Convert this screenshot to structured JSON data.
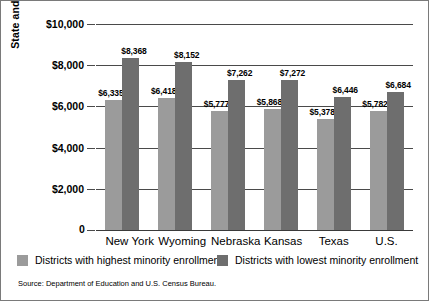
{
  "chart_data": {
    "type": "bar",
    "title": "",
    "subtitle": "",
    "xlabel": "",
    "ylabel": "State and local revenues available per student (2000)",
    "ylim": [
      0,
      10000
    ],
    "grid": true,
    "legend_position": "bottom",
    "categories": [
      "New York",
      "Wyoming",
      "Nebraska",
      "Kansas",
      "Texas",
      "U.S."
    ],
    "ytick_labels": [
      "$10,000",
      "$8,000",
      "$6,000",
      "$4,000",
      "$2,000",
      "0"
    ],
    "ytick_values": [
      10000,
      8000,
      6000,
      4000,
      2000,
      0
    ],
    "series": [
      {
        "name": "Districts with highest minority enrollment",
        "color": "#9b9b9b",
        "values": [
          6335,
          6418,
          5777,
          5868,
          5378,
          5782
        ],
        "labels": [
          "$6,335",
          "$6,418",
          "$5,777",
          "$5,868",
          "$5,378",
          "$5,782"
        ]
      },
      {
        "name": "Districts with lowest minority enrollment",
        "color": "#6e6e6e",
        "values": [
          8368,
          8152,
          7262,
          7272,
          6446,
          6684
        ],
        "labels": [
          "$8,368",
          "$8,152",
          "$7,262",
          "$7,272",
          "$6,446",
          "$6,684"
        ]
      }
    ],
    "source": "Source: Department of Education and U.S. Census Bureau."
  },
  "legend": {
    "items": [
      {
        "label": "Districts with highest minority enrollment",
        "color": "#9b9b9b"
      },
      {
        "label": "Districts with lowest minority enrollment",
        "color": "#6e6e6e"
      }
    ]
  },
  "axis": {
    "y_title": "State and local revenues available per student (2000)",
    "zero_label": "0"
  },
  "footer": {
    "source": "Source: Department of Education and U.S. Census Bureau."
  }
}
